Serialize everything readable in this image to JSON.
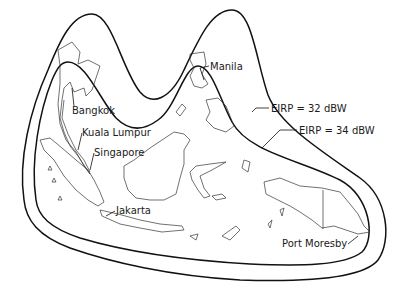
{
  "map": {
    "title": "",
    "region": "Southeast Asia",
    "colors": {
      "line": "#111111",
      "background": "#ffffff"
    },
    "contours": [
      {
        "id": "outer",
        "label": "EIRP = 32 dBW",
        "value_dbw": 32
      },
      {
        "id": "inner",
        "label": "EIRP = 34 dBW",
        "value_dbw": 34
      }
    ],
    "cities": [
      {
        "name": "Bangkok"
      },
      {
        "name": "Kuala Lumpur"
      },
      {
        "name": "Singapore"
      },
      {
        "name": "Manila"
      },
      {
        "name": "Jakarta"
      },
      {
        "name": "Port Moresby"
      }
    ]
  }
}
